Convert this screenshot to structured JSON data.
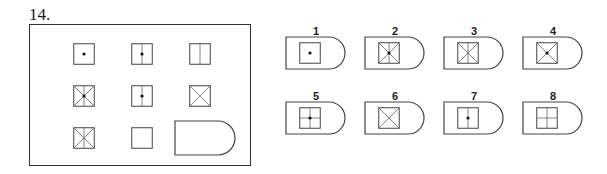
{
  "question": {
    "number": "14."
  },
  "matrix": {
    "cells": [
      {
        "row": 0,
        "col": 0,
        "features": [
          "dot"
        ]
      },
      {
        "row": 0,
        "col": 1,
        "features": [
          "vertical",
          "dot"
        ]
      },
      {
        "row": 0,
        "col": 2,
        "features": [
          "vertical"
        ]
      },
      {
        "row": 1,
        "col": 0,
        "features": [
          "x",
          "vertical",
          "dot"
        ]
      },
      {
        "row": 1,
        "col": 1,
        "features": [
          "vertical",
          "dot"
        ]
      },
      {
        "row": 1,
        "col": 2,
        "features": [
          "x"
        ]
      },
      {
        "row": 2,
        "col": 0,
        "features": [
          "x",
          "vertical"
        ]
      },
      {
        "row": 2,
        "col": 1,
        "features": []
      },
      {
        "row": 2,
        "col": 2,
        "features": [
          "missing"
        ]
      }
    ]
  },
  "options": [
    {
      "label": "1",
      "features": [
        "dot"
      ]
    },
    {
      "label": "2",
      "features": [
        "x",
        "vertical",
        "dot"
      ]
    },
    {
      "label": "3",
      "features": [
        "x",
        "vertical"
      ]
    },
    {
      "label": "4",
      "features": [
        "x",
        "dot"
      ]
    },
    {
      "label": "5",
      "features": [
        "vertical",
        "horizontal",
        "dot"
      ]
    },
    {
      "label": "6",
      "features": [
        "x"
      ]
    },
    {
      "label": "7",
      "features": [
        "vertical",
        "dot"
      ]
    },
    {
      "label": "8",
      "features": [
        "vertical",
        "horizontal"
      ]
    }
  ],
  "colors": {
    "stroke": "#444444",
    "inner_stroke": "#666666",
    "dot": "#111111"
  }
}
